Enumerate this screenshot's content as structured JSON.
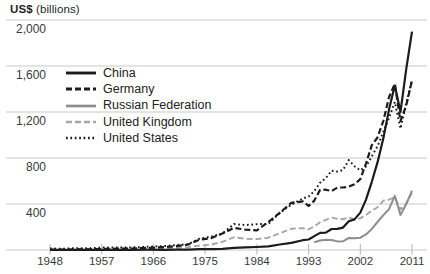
{
  "chart_data": {
    "type": "line",
    "axis_title": {
      "bold": "US$",
      "rest": "(billions)"
    },
    "grid": true,
    "legend_position": "upper-left-inside",
    "x_range": [
      1948,
      2011
    ],
    "ylim": [
      0,
      2080
    ],
    "y_ticks": [
      {
        "value": 2000,
        "label": "2,000"
      },
      {
        "value": 1600,
        "label": "1,600"
      },
      {
        "value": 1200,
        "label": "1,200"
      },
      {
        "value": 800,
        "label": "800"
      },
      {
        "value": 400,
        "label": "400"
      }
    ],
    "x_ticks": [
      {
        "value": 1948,
        "label": "1948"
      },
      {
        "value": 1957,
        "label": "1957"
      },
      {
        "value": 1966,
        "label": "1966"
      },
      {
        "value": 1975,
        "label": "1975"
      },
      {
        "value": 1984,
        "label": "1984"
      },
      {
        "value": 1993,
        "label": "1993"
      },
      {
        "value": 2002,
        "label": "2002"
      },
      {
        "value": 2011,
        "label": "2011"
      }
    ],
    "colors": {
      "black_series": "#1c1c1c",
      "russia_gray": "#8e8e8e",
      "uk_gray": "#a6a6a6",
      "gridline": "#c9c9c9",
      "tick": "#b5b5b5",
      "label_text": "#3a3a3a"
    },
    "x": [
      1948,
      1950,
      1952,
      1955,
      1957,
      1960,
      1962,
      1965,
      1968,
      1970,
      1972,
      1974,
      1976,
      1978,
      1980,
      1982,
      1984,
      1986,
      1988,
      1990,
      1992,
      1993,
      1994,
      1995,
      1996,
      1997,
      1998,
      1999,
      2000,
      2001,
      2002,
      2003,
      2004,
      2005,
      2006,
      2007,
      2008,
      2009,
      2010,
      2011
    ],
    "series": [
      {
        "name": "China",
        "color": "#1c1c1c",
        "style": "solid",
        "width": 2.2,
        "values": [
          0.5,
          0.6,
          0.8,
          1.4,
          1.6,
          1.9,
          1.5,
          2.2,
          2.1,
          2.3,
          3.4,
          6.9,
          6.9,
          9.7,
          18.1,
          22.3,
          26.1,
          30.9,
          47.5,
          62.1,
          84.9,
          91.7,
          121,
          148.8,
          151,
          182.8,
          183.7,
          194.9,
          249.2,
          266.1,
          325.6,
          438.2,
          593.3,
          762,
          969,
          1220.5,
          1430.7,
          1201.6,
          1577.8,
          1898.4
        ]
      },
      {
        "name": "Germany",
        "color": "#1c1c1c",
        "style": "dashed",
        "width": 2.2,
        "values": [
          0.8,
          2,
          4,
          6.1,
          8.6,
          11.4,
          13.3,
          17.9,
          24.8,
          34.2,
          46.7,
          89.4,
          102.2,
          142.5,
          192.9,
          176.4,
          171.7,
          243.3,
          323.4,
          410.1,
          422.3,
          382.5,
          429.7,
          523.8,
          524.2,
          512.4,
          543.4,
          543.5,
          550.2,
          571.4,
          615.8,
          751.6,
          911.7,
          977.9,
          1121.9,
          1328.8,
          1446.2,
          1120,
          1258.9,
          1473.9
        ]
      },
      {
        "name": "Russian Federation",
        "color": "#8e8e8e",
        "style": "solid",
        "width": 2,
        "values": [
          null,
          null,
          null,
          null,
          null,
          null,
          null,
          null,
          null,
          null,
          null,
          null,
          null,
          null,
          null,
          null,
          null,
          null,
          null,
          null,
          null,
          null,
          67.4,
          82.4,
          89.7,
          86.9,
          74.4,
          75.6,
          105,
          101.9,
          107.3,
          135.9,
          183.2,
          243.8,
          303.6,
          354.4,
          471.6,
          303.4,
          400.4,
          516.7
        ]
      },
      {
        "name": "United Kingdom",
        "color": "#a6a6a6",
        "style": "dashed",
        "width": 1.9,
        "values": [
          6.7,
          6.3,
          7.6,
          8.5,
          9.7,
          10.6,
          11.3,
          13.7,
          15.4,
          19.4,
          24.3,
          38.6,
          46.3,
          71.7,
          110.1,
          97,
          94.5,
          107.1,
          145.2,
          185.3,
          190,
          180.2,
          204.9,
          242,
          262.1,
          281.6,
          271.9,
          268.2,
          281.6,
          267.3,
          276.3,
          304.6,
          341.6,
          371.4,
          428.4,
          437,
          458.6,
          352.3,
          405.2,
          495.4
        ]
      },
      {
        "name": "United States",
        "color": "#1c1c1c",
        "style": "dotted",
        "width": 2,
        "values": [
          12.7,
          10.3,
          15.2,
          15.5,
          20.9,
          20.6,
          21.7,
          27.5,
          34.6,
          43.2,
          49.8,
          98.5,
          115.4,
          143.7,
          225.6,
          216.4,
          224,
          227.2,
          322.4,
          393.6,
          448.2,
          464.8,
          512.6,
          584.7,
          625.1,
          689.2,
          682.1,
          695.8,
          781.9,
          729.1,
          693.1,
          724.8,
          814.9,
          901.1,
          1025.9,
          1148.2,
          1287.4,
          1056,
          1278.5,
          1480.4
        ]
      }
    ]
  }
}
